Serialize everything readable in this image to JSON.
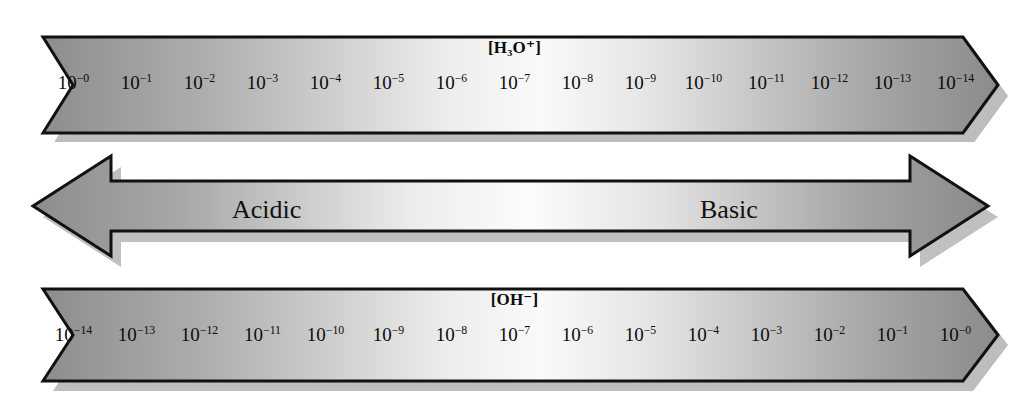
{
  "diagram": {
    "name": "ph-scale-diagram",
    "background": "#ffffff",
    "ink": "#0b0b0b",
    "gradient": {
      "dark": "#8e8e8e",
      "mid_dark": "#b4b4b4",
      "light": "#f8f8f8"
    }
  },
  "hydronium_bar": {
    "label": "[H₃O⁺]",
    "ticks": [
      {
        "base": "10",
        "exponent": "−0"
      },
      {
        "base": "10",
        "exponent": "−1"
      },
      {
        "base": "10",
        "exponent": "−2"
      },
      {
        "base": "10",
        "exponent": "−3"
      },
      {
        "base": "10",
        "exponent": "−4"
      },
      {
        "base": "10",
        "exponent": "−5"
      },
      {
        "base": "10",
        "exponent": "−6"
      },
      {
        "base": "10",
        "exponent": "−7"
      },
      {
        "base": "10",
        "exponent": "−8"
      },
      {
        "base": "10",
        "exponent": "−9"
      },
      {
        "base": "10",
        "exponent": "−10"
      },
      {
        "base": "10",
        "exponent": "−11"
      },
      {
        "base": "10",
        "exponent": "−12"
      },
      {
        "base": "10",
        "exponent": "−13"
      },
      {
        "base": "10",
        "exponent": "−14"
      }
    ]
  },
  "hydroxide_bar": {
    "label": "[OH⁻]",
    "ticks": [
      {
        "base": "10",
        "exponent": "−14"
      },
      {
        "base": "10",
        "exponent": "−13"
      },
      {
        "base": "10",
        "exponent": "−12"
      },
      {
        "base": "10",
        "exponent": "−11"
      },
      {
        "base": "10",
        "exponent": "−10"
      },
      {
        "base": "10",
        "exponent": "−9"
      },
      {
        "base": "10",
        "exponent": "−8"
      },
      {
        "base": "10",
        "exponent": "−7"
      },
      {
        "base": "10",
        "exponent": "−6"
      },
      {
        "base": "10",
        "exponent": "−5"
      },
      {
        "base": "10",
        "exponent": "−4"
      },
      {
        "base": "10",
        "exponent": "−3"
      },
      {
        "base": "10",
        "exponent": "−2"
      },
      {
        "base": "10",
        "exponent": "−1"
      },
      {
        "base": "10",
        "exponent": "−0"
      }
    ]
  },
  "ph_arrow": {
    "left_label": "Acidic",
    "right_label": "Basic"
  },
  "chart_data": {
    "type": "table",
    "categories": [
      "10⁻⁰",
      "10⁻¹",
      "10⁻²",
      "10⁻³",
      "10⁻⁴",
      "10⁻⁵",
      "10⁻⁶",
      "10⁻⁷",
      "10⁻⁸",
      "10⁻⁹",
      "10⁻¹⁰",
      "10⁻¹¹",
      "10⁻¹²",
      "10⁻¹³",
      "10⁻¹⁴"
    ],
    "series": [
      {
        "name": "[H₃O⁺]",
        "values": [
          0,
          -1,
          -2,
          -3,
          -4,
          -5,
          -6,
          -7,
          -8,
          -9,
          -10,
          -11,
          -12,
          -13,
          -14
        ]
      },
      {
        "name": "[OH⁻]",
        "values": [
          -14,
          -13,
          -12,
          -11,
          -10,
          -9,
          -8,
          -7,
          -6,
          -5,
          -4,
          -3,
          -2,
          -1,
          0
        ]
      }
    ],
    "annotations": [
      "Acidic",
      "Basic"
    ],
    "xlabel": "",
    "ylabel": "log₁₀ concentration (mol/L)",
    "grid": false,
    "legend": "none"
  }
}
